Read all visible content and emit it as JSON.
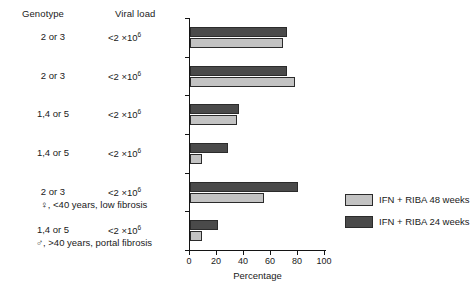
{
  "headers": {
    "genotype": "Genotype",
    "viral_load": "Viral load"
  },
  "rows": [
    {
      "genotype": "2 or 3",
      "viral_load_prefix": "<2 ×10",
      "viral_load_exp": "6",
      "sub": ""
    },
    {
      "genotype": "2 or 3",
      "viral_load_prefix": "<2 ×10",
      "viral_load_exp": "6",
      "sub": ""
    },
    {
      "genotype": "1,4 or 5",
      "viral_load_prefix": "<2 ×10",
      "viral_load_exp": "6",
      "sub": ""
    },
    {
      "genotype": "1,4 or 5",
      "viral_load_prefix": "<2 ×10",
      "viral_load_exp": "6",
      "sub": ""
    },
    {
      "genotype": "2 or 3",
      "viral_load_prefix": "<2 ×10",
      "viral_load_exp": "6",
      "sub": "♀, <40 years, low fibrosis"
    },
    {
      "genotype": "1,4 or 5",
      "viral_load_prefix": "<2 ×10",
      "viral_load_exp": "6",
      "sub": "♂, >40 years, portal fibrosis"
    }
  ],
  "legend": [
    {
      "label": "IFN + RIBA 48 weeks",
      "color": "#c3c3c3",
      "key": "light"
    },
    {
      "label": "IFN + RIBA 24 weeks",
      "color": "#4a4a4a",
      "key": "dark"
    }
  ],
  "axis": {
    "xlabel": "Percentage",
    "xticks": [
      "0",
      "20",
      "40",
      "60",
      "80",
      "100"
    ]
  },
  "chart_data": {
    "type": "bar",
    "orientation": "horizontal",
    "title": "",
    "xlabel": "Percentage",
    "ylabel": "",
    "xlim": [
      0,
      100
    ],
    "grid": false,
    "legend_position": "right-bottom",
    "categories": [
      "2 or 3 | <2 ×10⁶",
      "2 or 3 | <2 ×10⁶",
      "1,4 or 5 | <2 ×10⁶",
      "1,4 or 5 | <2 ×10⁶",
      "2 or 3 | <2 ×10⁶ | ♀, <40 years, low fibrosis",
      "1,4 or 5 | <2 ×10⁶ | ♂, >40 years, portal fibrosis"
    ],
    "series": [
      {
        "name": "IFN + RIBA 24 weeks",
        "color": "#4a4a4a",
        "values": [
          72,
          72,
          36,
          28,
          80,
          21
        ]
      },
      {
        "name": "IFN + RIBA 48 weeks",
        "color": "#c3c3c3",
        "values": [
          69,
          78,
          35,
          9,
          55,
          9
        ]
      }
    ]
  }
}
